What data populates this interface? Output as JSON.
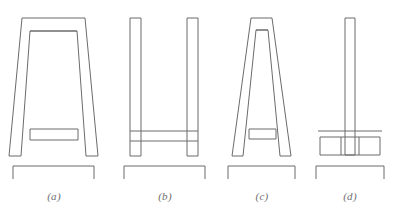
{
  "figure": {
    "background_color": "#ffffff",
    "line_color": "#6b6b6b",
    "caption_color": "#6e6e6e",
    "panel_count": 4
  },
  "panels": [
    {
      "id": "a",
      "caption": "(a)",
      "shape_name": "tapered-trapezoid-frame",
      "description": "Wide trapezoidal frame with two splayed legs and a low horizontal stretcher rail",
      "outer_top_left_x": 22,
      "outer_top_right_x": 85,
      "outer_bottom_left_x": 9,
      "outer_bottom_right_x": 98,
      "top_y": 18,
      "bottom_y": 156,
      "rail_label": "stretcher-rail",
      "rail_top_y": 129,
      "rail_bottom_y": 140,
      "bracket_left_x": 13,
      "bracket_right_x": 94,
      "bracket_y": 166,
      "bracket_tick_length": 13
    },
    {
      "id": "b",
      "caption": "(b)",
      "shape_name": "parallel-post-frame",
      "description": "Two straight vertical posts joined by a through horizontal rail near the base",
      "left_post_x": 130,
      "left_post_width": 11,
      "right_post_x": 187,
      "right_post_width": 11,
      "top_y": 18,
      "bottom_y": 156,
      "rail_label": "through-rail",
      "rail_top_y": 131,
      "rail_bottom_y": 141,
      "bracket_left_x": 124,
      "bracket_right_x": 205,
      "bracket_y": 166,
      "bracket_tick_length": 13
    },
    {
      "id": "c",
      "caption": "(c)",
      "shape_name": "a-frame",
      "description": "Narrow A-frame with steeply splayed legs and a horizontal stretcher rail",
      "apex_left_x": 251,
      "apex_right_x": 272,
      "foot_left_x": 232,
      "foot_right_x": 291,
      "top_y": 18,
      "bottom_y": 156,
      "rail_label": "stretcher-rail",
      "rail_top_y": 129,
      "rail_bottom_y": 139,
      "bracket_left_x": 228,
      "bracket_right_x": 295,
      "bracket_y": 166,
      "bracket_tick_length": 13
    },
    {
      "id": "d",
      "caption": "(d)",
      "shape_name": "center-post-pedestal",
      "description": "Single central vertical post rising from a wide boxed pedestal base",
      "post_x": 345,
      "post_width": 10,
      "top_y": 18,
      "bottom_y": 156,
      "base_label": "pedestal-base",
      "base_left_x": 320,
      "base_right_x": 380,
      "base_top_y": 137,
      "base_bottom_y": 155,
      "shelf_line_y": 131,
      "shelf_left_x": 318,
      "shelf_right_x": 382,
      "bracket_left_x": 316,
      "bracket_right_x": 384,
      "bracket_y": 166,
      "bracket_tick_length": 13
    }
  ]
}
